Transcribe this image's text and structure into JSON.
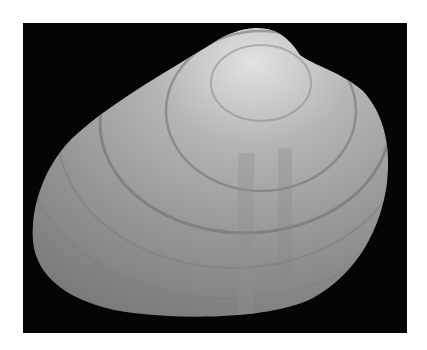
{
  "image": {
    "subject": "Bivalve clam shell photographed on black background",
    "alt": "Grayscale photograph of a clam shell with concentric growth rings",
    "colors": {
      "background": "#ffffff",
      "frame": "#050505",
      "shell_light": "#d8d8d8",
      "shell_mid": "#9a9a9a",
      "shell_dark": "#6e6e6e",
      "ring": "#707070"
    }
  }
}
